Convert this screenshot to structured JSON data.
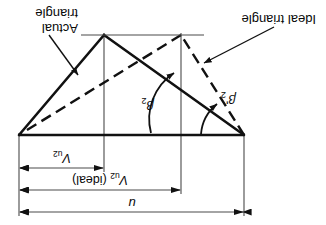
{
  "figure": {
    "orientation": "rotated-180",
    "ink_color": "#111111",
    "thin_color": "#555555",
    "dimensions": [
      {
        "id": "u",
        "label": "u",
        "from_x": 82,
        "to_x": 307,
        "y": 13
      },
      {
        "id": "vu2_ideal",
        "label": "V",
        "sub": "u2",
        "suffix": " (ideal)",
        "from_x": 145,
        "to_x": 307,
        "y": 35
      },
      {
        "id": "vu2_actual",
        "label": "V",
        "sub": "u2",
        "suffix": "",
        "from_x": 222,
        "to_x": 307,
        "y": 57
      }
    ],
    "angles": [
      {
        "id": "beta2_prime",
        "label": "β",
        "sub": "2",
        "prime": "'",
        "at": "left-apex"
      },
      {
        "id": "beta2",
        "label": "β",
        "sub": "2",
        "prime": "",
        "at": "bottom-vertex"
      }
    ],
    "callouts": [
      {
        "id": "ideal-triangle",
        "lines": [
          "Ideal triangle"
        ]
      },
      {
        "id": "actual-triangle",
        "lines": [
          "Actual",
          "triangle"
        ]
      }
    ],
    "geometry": {
      "baseline": {
        "x1": 82,
        "y1": 90,
        "x2": 307,
        "y2": 90
      },
      "apex_left": {
        "x": 82,
        "y": 90
      },
      "apex_right": {
        "x": 307,
        "y": 90
      },
      "vertex_ideal": {
        "x": 145,
        "y": 190
      },
      "vertex_actual": {
        "x": 222,
        "y": 190
      }
    }
  }
}
